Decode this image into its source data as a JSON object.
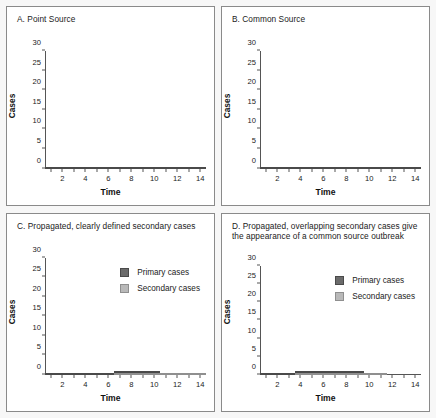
{
  "figure": {
    "axis_ylabel": "Cases",
    "axis_xlabel": "Time",
    "legend": {
      "primary": "Primary cases",
      "secondary": "Secondary cases"
    },
    "colors": {
      "primary": "#6b6b6b",
      "secondary": "#b9b9b9",
      "panel_border": "#8a8a8a",
      "background": "#f7f7f7",
      "panel_background": "#ffffff",
      "axis": "#555555"
    }
  },
  "chart_data": [
    {
      "type": "bar",
      "panel": "A",
      "title": "A. Point Source",
      "xlabel": "Time",
      "ylabel": "Cases",
      "xlim": [
        0.5,
        14.5
      ],
      "ylim": [
        0,
        30
      ],
      "yticks": [
        0,
        5,
        10,
        15,
        20,
        25,
        30
      ],
      "xticks": [
        2,
        4,
        6,
        8,
        10,
        12,
        14
      ],
      "grid": false,
      "legend_position": "none",
      "categories": [
        1,
        2,
        3,
        4,
        5,
        6,
        7,
        8,
        9,
        10,
        11,
        12,
        13,
        14
      ],
      "values": [
        15,
        30,
        27,
        20,
        17,
        14,
        9,
        7.5,
        5,
        1.5,
        1,
        0.5,
        0.2,
        0.2
      ]
    },
    {
      "type": "bar",
      "panel": "B",
      "title": "B. Common Source",
      "xlabel": "Time",
      "ylabel": "Cases",
      "xlim": [
        0.5,
        14.5
      ],
      "ylim": [
        0,
        30
      ],
      "yticks": [
        0,
        5,
        10,
        15,
        20,
        25,
        30
      ],
      "xticks": [
        2,
        4,
        6,
        8,
        10,
        12,
        14
      ],
      "grid": false,
      "legend_position": "none",
      "categories": [
        1,
        2,
        3,
        4,
        5,
        6,
        7,
        8,
        9,
        10,
        11,
        12,
        13,
        14
      ],
      "values": [
        25,
        30,
        22,
        25,
        29,
        23,
        21,
        27,
        21,
        19,
        16,
        13,
        10,
        6.5
      ]
    },
    {
      "type": "bar",
      "panel": "C",
      "title": "C. Propagated, clearly defined secondary cases",
      "xlabel": "Time",
      "ylabel": "Cases",
      "xlim": [
        0.5,
        14.5
      ],
      "ylim": [
        0,
        30
      ],
      "yticks": [
        0,
        5,
        10,
        15,
        20,
        25,
        30
      ],
      "xticks": [
        2,
        4,
        6,
        8,
        10,
        12,
        14
      ],
      "grid": false,
      "stacked": true,
      "legend_position": "upper right",
      "categories": [
        1,
        2,
        3,
        4,
        5,
        6,
        7,
        8,
        9,
        10,
        11,
        12,
        13,
        14
      ],
      "series": [
        {
          "name": "Secondary cases",
          "values": [
            0,
            0,
            0,
            0,
            0,
            0,
            10,
            7,
            5,
            3,
            3,
            2,
            1,
            1
          ]
        },
        {
          "name": "Primary cases",
          "values": [
            7,
            25,
            22,
            14,
            11,
            7,
            5,
            3,
            1,
            1,
            0,
            0,
            0,
            0
          ]
        }
      ]
    },
    {
      "type": "bar",
      "panel": "D",
      "title": "D. Propagated, overlapping secondary cases give the appearance of a common source outbreak",
      "xlabel": "Time",
      "ylabel": "Cases",
      "xlim": [
        0.5,
        14.5
      ],
      "ylim": [
        0,
        30
      ],
      "yticks": [
        0,
        5,
        10,
        15,
        20,
        25,
        30
      ],
      "xticks": [
        2,
        4,
        6,
        8,
        10,
        12,
        14
      ],
      "grid": false,
      "stacked": true,
      "legend_position": "upper right",
      "categories": [
        1,
        2,
        3,
        4,
        5,
        6,
        7,
        8,
        9,
        10,
        11,
        12,
        13,
        14
      ],
      "series": [
        {
          "name": "Secondary cases",
          "values": [
            0,
            0,
            0,
            10,
            7,
            5,
            3,
            3,
            2,
            2,
            1,
            0,
            0,
            0
          ]
        },
        {
          "name": "Primary cases",
          "values": [
            7,
            25,
            22,
            14,
            11,
            7,
            5,
            3,
            1,
            0,
            0,
            0,
            0,
            0
          ]
        }
      ]
    }
  ]
}
